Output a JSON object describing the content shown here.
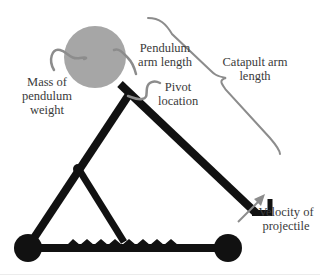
{
  "diagram": {
    "labels": {
      "mass": [
        "Mass of",
        "pendulum",
        "weight"
      ],
      "pendulum_arm": [
        "Pendulum",
        "arm length"
      ],
      "pivot": [
        "Pivot",
        "location"
      ],
      "catapult_arm": [
        "Catapult arm",
        "length"
      ],
      "velocity": [
        "Velocity of",
        "projectile"
      ]
    },
    "colors": {
      "structure": "#111111",
      "weight": "#a6a6a6",
      "annotation": "#8c8c8c",
      "text": "#3a3a3a"
    }
  }
}
